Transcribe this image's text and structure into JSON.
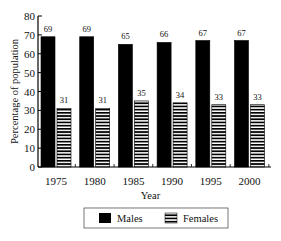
{
  "chart_data": {
    "type": "bar",
    "title": "",
    "xlabel": "Year",
    "ylabel": "Percentage of population",
    "ylim": [
      0,
      80
    ],
    "yticks": [
      0,
      10,
      20,
      30,
      40,
      50,
      60,
      70,
      80
    ],
    "categories": [
      "1975",
      "1980",
      "1985",
      "1990",
      "1995",
      "2000"
    ],
    "series": [
      {
        "name": "Males",
        "values": [
          69,
          69,
          65,
          66,
          67,
          67
        ],
        "fill": "solid",
        "color": "#000000"
      },
      {
        "name": "Females",
        "values": [
          31,
          31,
          35,
          34,
          33,
          33
        ],
        "fill": "horizontal-stripes",
        "color": "#000000"
      }
    ],
    "data_labels": true,
    "grid": false,
    "legend": {
      "position": "bottom",
      "entries": [
        "Males",
        "Females"
      ]
    }
  }
}
